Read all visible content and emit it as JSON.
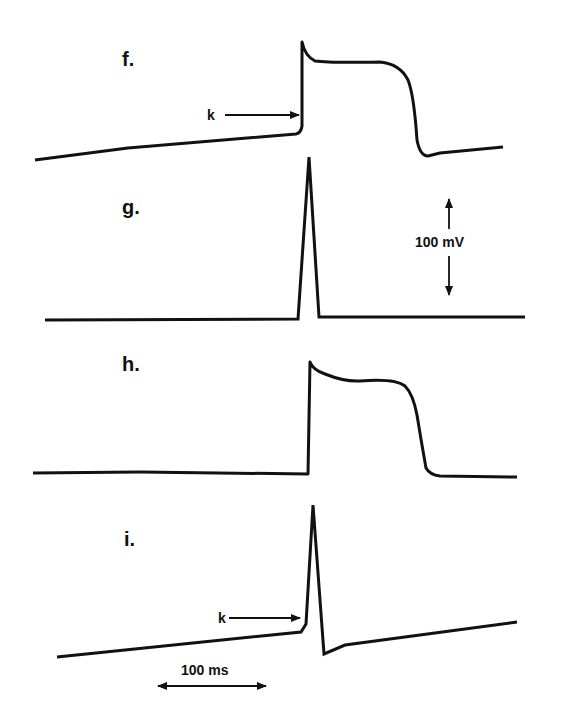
{
  "figure": {
    "panels": [
      {
        "id": "f",
        "label": "f.",
        "marker": "k"
      },
      {
        "id": "g",
        "label": "g."
      },
      {
        "id": "h",
        "label": "h."
      },
      {
        "id": "i",
        "label": "i.",
        "marker": "k"
      }
    ],
    "scale_bars": {
      "voltage": "100 mV",
      "time": "100 ms"
    }
  },
  "colors": {
    "trace": "#111111",
    "background": "#ffffff"
  }
}
